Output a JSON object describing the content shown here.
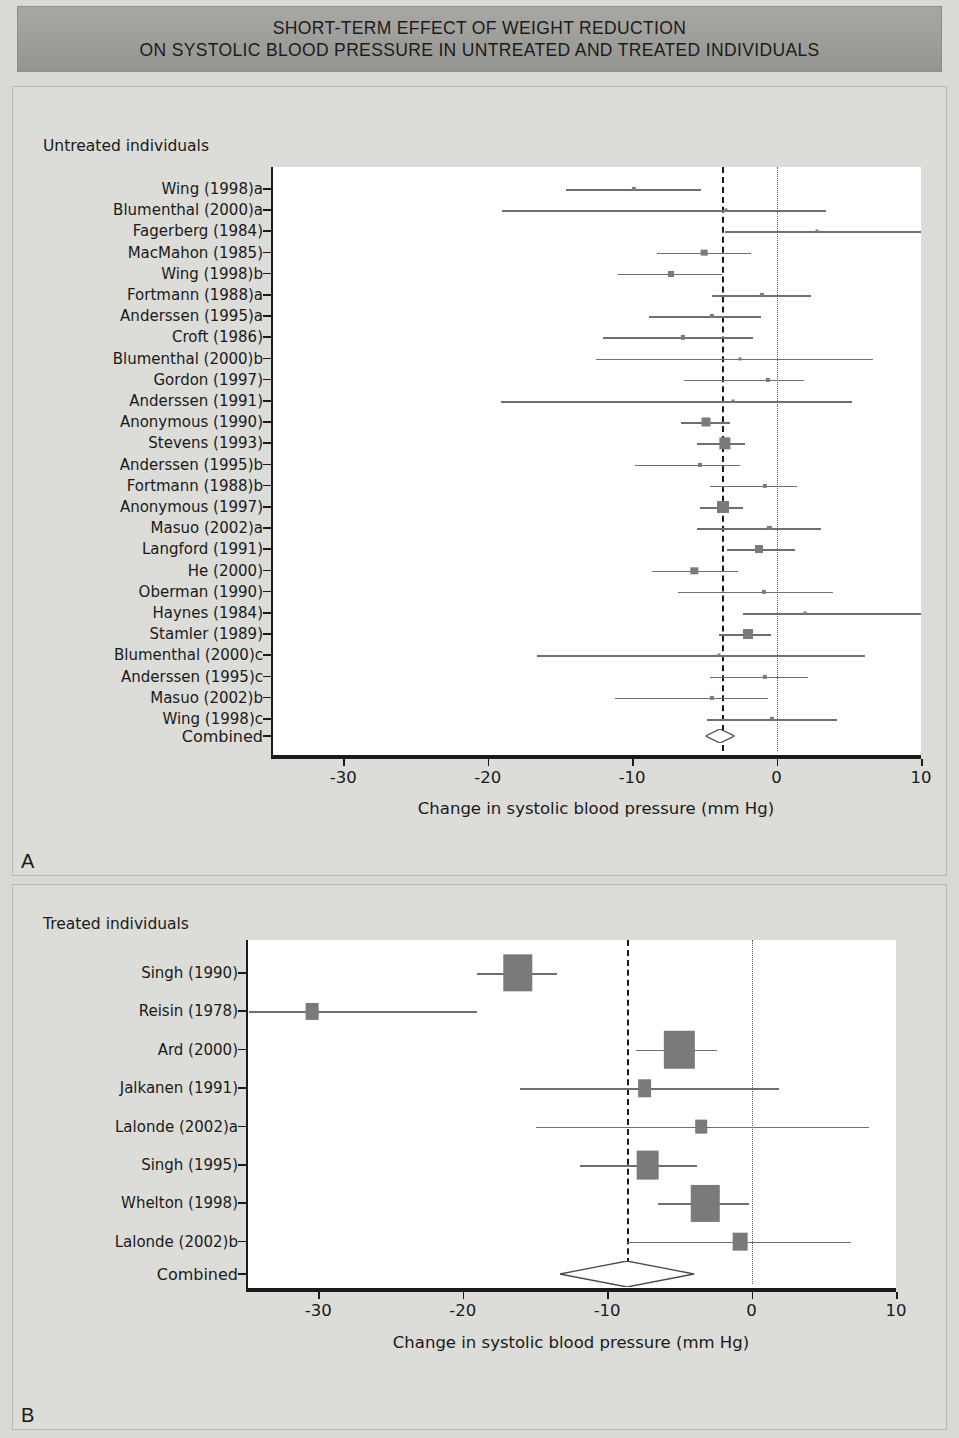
{
  "title": {
    "line1": "SHORT-TERM EFFECT OF WEIGHT REDUCTION",
    "line2": "ON SYSTOLIC BLOOD PRESSURE IN UNTREATED AND TREATED INDIVIDUALS"
  },
  "panels": {
    "a": {
      "letter": "A",
      "group_title": "Untreated individuals"
    },
    "b": {
      "letter": "B",
      "group_title": "Treated individuals"
    }
  },
  "axis": {
    "xlabel": "Change in systolic blood pressure (mm Hg)",
    "ticks": [
      "-30",
      "-20",
      "-10",
      "0",
      "10"
    ],
    "tick_values": [
      -30,
      -20,
      -10,
      0,
      10
    ],
    "xmin": -35,
    "xmax": 10
  },
  "combined_label": "Combined",
  "colors": {
    "banner": "#9d9d99",
    "page_background": "#d9d9d5",
    "panel_background": "#dcdcd8",
    "plot_background": "#ffffff",
    "marker": "#7a7a7a",
    "ci_line": "#6f6f6f",
    "axis": "#1a1a1a",
    "null_line": "#1a1a1a",
    "zero_line": "#5a5a5a"
  },
  "chart_data": [
    {
      "type": "forest",
      "panel": "A",
      "title": "Untreated individuals",
      "xlabel": "Change in systolic blood pressure (mm Hg)",
      "ylabel": "",
      "xlim": [
        -35,
        10
      ],
      "xticks": [
        -30,
        -20,
        -10,
        0,
        10
      ],
      "grid": false,
      "null_line": -3.8,
      "zero_line": 0,
      "studies": [
        {
          "label": "Wing (1998)a",
          "estimate": -9.9,
          "ci_low": -14.6,
          "ci_high": -5.2,
          "weight": 2
        },
        {
          "label": "Blumenthal (2000)a",
          "estimate": -3.5,
          "ci_low": -19.0,
          "ci_high": 3.4,
          "weight": 1
        },
        {
          "label": "Fagerberg (1984)",
          "estimate": 2.8,
          "ci_low": -3.6,
          "ci_high": 10.2,
          "weight": 1
        },
        {
          "label": "MacMahon (1985)",
          "estimate": -5.0,
          "ci_low": -8.3,
          "ci_high": -1.8,
          "weight": 5
        },
        {
          "label": "Wing (1998)b",
          "estimate": -7.3,
          "ci_low": -11.0,
          "ci_high": -3.8,
          "weight": 4
        },
        {
          "label": "Fortmann (1988)a",
          "estimate": -1.0,
          "ci_low": -4.5,
          "ci_high": 2.4,
          "weight": 2
        },
        {
          "label": "Anderssen (1995)a",
          "estimate": -4.5,
          "ci_low": -8.8,
          "ci_high": -1.1,
          "weight": 2
        },
        {
          "label": "Croft (1986)",
          "estimate": -6.5,
          "ci_low": -12.0,
          "ci_high": -1.6,
          "weight": 2
        },
        {
          "label": "Blumenthal (2000)b",
          "estimate": -2.5,
          "ci_low": -12.5,
          "ci_high": 6.7,
          "weight": 1
        },
        {
          "label": "Gordon (1997)",
          "estimate": -0.6,
          "ci_low": -6.4,
          "ci_high": 1.9,
          "weight": 2
        },
        {
          "label": "Anderssen (1991)",
          "estimate": -3.0,
          "ci_low": -19.1,
          "ci_high": 5.2,
          "weight": 1
        },
        {
          "label": "Anonymous (1990)",
          "estimate": -4.9,
          "ci_low": -6.6,
          "ci_high": -3.2,
          "weight": 9
        },
        {
          "label": "Stevens (1993)",
          "estimate": -3.6,
          "ci_low": -5.5,
          "ci_high": -2.2,
          "weight": 14
        },
        {
          "label": "Anderssen (1995)b",
          "estimate": -5.3,
          "ci_low": -9.8,
          "ci_high": -2.5,
          "weight": 2
        },
        {
          "label": "Fortmann (1988)b",
          "estimate": -0.8,
          "ci_low": -4.6,
          "ci_high": 1.4,
          "weight": 2
        },
        {
          "label": "Anonymous (1997)",
          "estimate": -3.7,
          "ci_low": -5.3,
          "ci_high": -2.3,
          "weight": 16
        },
        {
          "label": "Masuo (2002)a",
          "estimate": -0.5,
          "ci_low": -5.5,
          "ci_high": 3.1,
          "weight": 2
        },
        {
          "label": "Langford (1991)",
          "estimate": -1.2,
          "ci_low": -3.4,
          "ci_high": 1.3,
          "weight": 7
        },
        {
          "label": "He (2000)",
          "estimate": -5.7,
          "ci_low": -8.6,
          "ci_high": -2.7,
          "weight": 6
        },
        {
          "label": "Oberman (1990)",
          "estimate": -0.9,
          "ci_low": -6.8,
          "ci_high": 3.9,
          "weight": 2
        },
        {
          "label": "Haynes (1984)",
          "estimate": 2.0,
          "ci_low": -2.3,
          "ci_high": 10.3,
          "weight": 1
        },
        {
          "label": "Stamler (1989)",
          "estimate": -2.0,
          "ci_low": -4.0,
          "ci_high": -0.4,
          "weight": 11
        },
        {
          "label": "Blumenthal (2000)c",
          "estimate": -4.0,
          "ci_low": -16.6,
          "ci_high": 6.1,
          "weight": 1
        },
        {
          "label": "Anderssen (1995)c",
          "estimate": -0.8,
          "ci_low": -4.6,
          "ci_high": 2.2,
          "weight": 2
        },
        {
          "label": "Masuo (2002)b",
          "estimate": -4.5,
          "ci_low": -11.2,
          "ci_high": -0.6,
          "weight": 2
        },
        {
          "label": "Wing (1998)c",
          "estimate": -0.3,
          "ci_low": -4.8,
          "ci_high": 4.2,
          "weight": 2
        }
      ],
      "combined": {
        "label": "Combined",
        "estimate": -3.9,
        "ci_low": -4.8,
        "ci_high": -2.8
      }
    },
    {
      "type": "forest",
      "panel": "B",
      "title": "Treated individuals",
      "xlabel": "Change in systolic blood pressure (mm Hg)",
      "ylabel": "",
      "xlim": [
        -35,
        10
      ],
      "xticks": [
        -30,
        -20,
        -10,
        0,
        10
      ],
      "grid": false,
      "null_line": -8.6,
      "zero_line": 0,
      "studies": [
        {
          "label": "Singh (1990)",
          "estimate": -16.2,
          "ci_low": -19.0,
          "ci_high": -13.5,
          "weight": 32
        },
        {
          "label": "Reisin (1978)",
          "estimate": -30.4,
          "ci_low": -34.8,
          "ci_high": -19.0,
          "weight": 6
        },
        {
          "label": "Ard (2000)",
          "estimate": -5.0,
          "ci_low": -8.0,
          "ci_high": -2.4,
          "weight": 34
        },
        {
          "label": "Jalkanen (1991)",
          "estimate": -7.4,
          "ci_low": -16.0,
          "ci_high": 1.9,
          "weight": 7
        },
        {
          "label": "Lalonde (2002)a",
          "estimate": -3.5,
          "ci_low": -14.9,
          "ci_high": 8.1,
          "weight": 5
        },
        {
          "label": "Singh (1995)",
          "estimate": -7.2,
          "ci_low": -11.9,
          "ci_high": -3.8,
          "weight": 19
        },
        {
          "label": "Whelton (1998)",
          "estimate": -3.2,
          "ci_low": -6.5,
          "ci_high": -0.2,
          "weight": 30
        },
        {
          "label": "Lalonde (2002)b",
          "estimate": -0.8,
          "ci_low": -8.6,
          "ci_high": 6.9,
          "weight": 8
        }
      ],
      "combined": {
        "label": "Combined",
        "estimate": -8.6,
        "ci_low": -13.5,
        "ci_high": -4.2
      }
    }
  ]
}
